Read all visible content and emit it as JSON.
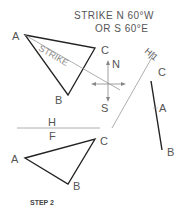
{
  "title": {
    "line1": "STRIKE  N 60°W",
    "line2": "OR S 60°E"
  },
  "top_view": {
    "vertices": {
      "A": "A",
      "B": "B",
      "C": "C"
    },
    "strike_label": "STRIKE"
  },
  "compass": {
    "north": "N",
    "south": "S"
  },
  "fold_line_hi": {
    "label": "H|1"
  },
  "edge_view": {
    "labels": {
      "C": "C",
      "A": "A",
      "B": "B"
    }
  },
  "fold_line_hf": {
    "above": "H",
    "below": "F"
  },
  "front_view": {
    "vertices": {
      "A": "A",
      "B": "B",
      "C": "C"
    }
  },
  "caption": "STEP 2",
  "colors": {
    "line": "#222222",
    "thin": "#888888",
    "text": "#555555"
  }
}
